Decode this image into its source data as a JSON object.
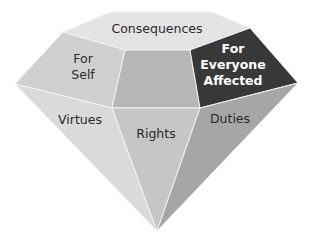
{
  "diagram": {
    "type": "gem-facets",
    "colors": {
      "top": "#e4e4e4",
      "for_self": "#d0d0d0",
      "center": "#b6b6b6",
      "for_everyone": "#383838",
      "virtues": "#dadada",
      "rights": "#c6c6c6",
      "duties": "#a6a6a6",
      "edge": "#f4f4f4"
    },
    "facets": {
      "top": {
        "label": "Consequences"
      },
      "for_self": {
        "line1": "For",
        "line2": "Self"
      },
      "for_everyone": {
        "line1": "For",
        "line2": "Everyone",
        "line3": "Affected"
      },
      "virtues": {
        "label": "Virtues"
      },
      "rights": {
        "label": "Rights"
      },
      "duties": {
        "label": "Duties"
      }
    }
  }
}
